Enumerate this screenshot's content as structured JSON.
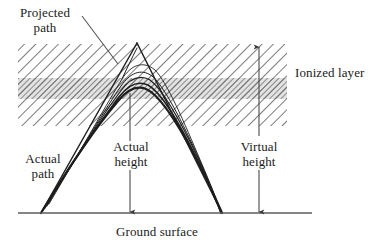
{
  "figure": {
    "type": "diagram",
    "background_color": "#ffffff",
    "ink_color": "#1a1a1a",
    "hatch_color": "#4a4a4a"
  },
  "labels": {
    "projected_path": {
      "line1": "Projected",
      "line2": "path"
    },
    "ionized_layer": "Ionized layer",
    "actual_path": {
      "line1": "Actual",
      "line2": "path"
    },
    "actual_height": {
      "line1": "Actual",
      "line2": "height"
    },
    "virtual_height": {
      "line1": "Virtual",
      "line2": "height"
    },
    "ground_surface": "Ground surface"
  },
  "geometry": {
    "ionized_layer": {
      "left": 18,
      "right": 287,
      "top": 44,
      "bottom": 126,
      "dense_core_top": 78,
      "dense_core_bottom": 99,
      "hatch_angle_deg": 45
    },
    "ground_surface": {
      "y": 213,
      "x_start": 18,
      "x_end": 312
    },
    "projected_path": {
      "apex_x": 137,
      "apex_y": 43,
      "left_foot_x": 41,
      "right_foot_x": 222
    },
    "actual_path": {
      "transmitter_x": 41,
      "receiver_x": 222,
      "peak_x": 130,
      "peak_y": 85,
      "ray_count": 5
    },
    "actual_height_arrow": {
      "x": 130,
      "y_top": 128,
      "y_bottom": 213
    },
    "virtual_height_arrow": {
      "x": 259,
      "y_top": 46,
      "y_bottom": 213
    },
    "projected_path_leader": {
      "x1": 82,
      "y1": 16,
      "x2": 118,
      "y2": 64
    },
    "actual_height_leader": {
      "x1": 131,
      "y1": 133,
      "x2": 131,
      "y2": 92
    }
  }
}
